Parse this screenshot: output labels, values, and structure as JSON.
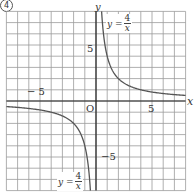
{
  "figure_label": "4",
  "chart_data": {
    "type": "line",
    "title": "",
    "xlabel": "x",
    "ylabel": "y",
    "xlim": [
      -8,
      8
    ],
    "ylim": [
      -8,
      8
    ],
    "grid": true,
    "grid_step": 1,
    "origin_label": "O",
    "tick_labels": {
      "x": [
        {
          "value": -5,
          "text": "− 5"
        },
        {
          "value": 5,
          "text": "5"
        }
      ],
      "y": [
        {
          "value": 5,
          "text": "5"
        },
        {
          "value": -5,
          "text": "−5"
        }
      ]
    },
    "series": [
      {
        "name": "y = 4/x (x>0)",
        "function": "4/x",
        "domain": [
          0.5,
          8
        ],
        "color": "#555555"
      },
      {
        "name": "y = 4/x (x<0)",
        "function": "4/x",
        "domain": [
          -8,
          -0.5
        ],
        "color": "#555555"
      }
    ],
    "annotations": [
      {
        "text": "y = 4/x",
        "near": "upper-right branch"
      },
      {
        "text": "y = 4/x",
        "near": "lower-left branch"
      }
    ]
  },
  "labels": {
    "x_axis": "x",
    "y_axis": "y",
    "origin": "O",
    "x_pos5": "5",
    "x_neg5": "− 5",
    "y_pos5": "5",
    "y_neg5": "−5",
    "eq_lhs": "y =",
    "eq_num": "4",
    "eq_den": "x"
  },
  "colors": {
    "grid": "#9a9a9a",
    "axis": "#222222",
    "curve": "#555555",
    "text": "#333333"
  }
}
